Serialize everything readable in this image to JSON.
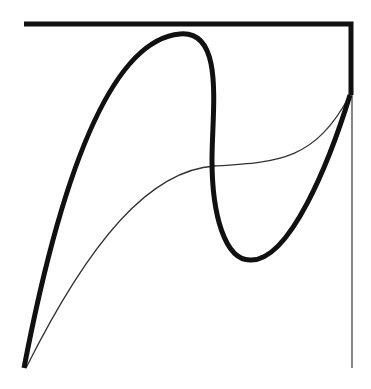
{
  "diagram": {
    "type": "bezier-curves",
    "colors": {
      "stroke": "#111111",
      "background": "#ffffff",
      "thin": "#333333"
    },
    "control_polygon": {
      "points": [
        [
          24,
          24
        ],
        [
          351,
          24
        ],
        [
          351,
          95
        ]
      ],
      "stroke_width": 5
    },
    "guide_line": {
      "from": [
        352,
        95
      ],
      "to": [
        352,
        368
      ],
      "stroke_width": 1.2
    },
    "thick_curve": {
      "d": "M 24 368 C 60 180, 110 40, 180 34 C 225 30, 212 110, 212 160 C 212 215, 225 260, 250 260 C 290 262, 330 160, 350 95",
      "stroke_width": 5
    },
    "thin_curve": {
      "d": "M 26 368 C 90 240, 150 170, 215 166 C 280 162, 315 160, 350 95",
      "stroke_width": 1.3
    }
  }
}
